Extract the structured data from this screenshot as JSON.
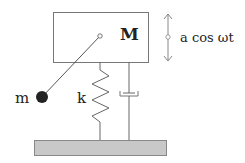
{
  "diagram": {
    "mass_label": "M",
    "pendulum_mass_label": "m",
    "spring_label": "k",
    "forcing_label": "a cos ωt",
    "colors": {
      "line": "#555555",
      "ground_fill": "#c8c8c8",
      "ground_stroke": "#888888",
      "ball": "#222222",
      "box_stroke": "#777777"
    }
  }
}
